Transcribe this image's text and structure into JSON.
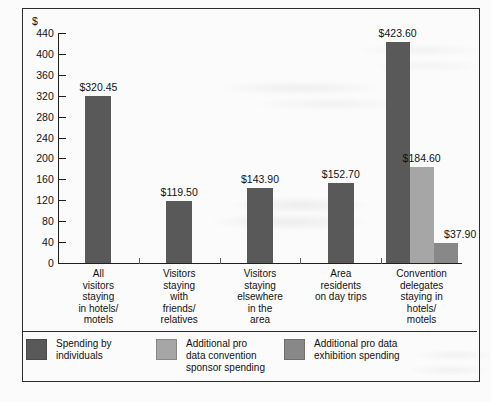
{
  "chart_data": {
    "type": "bar",
    "title": "",
    "xlabel": "",
    "ylabel": "$",
    "ylim": [
      0,
      440
    ],
    "yticks": [
      0,
      40,
      80,
      120,
      160,
      200,
      240,
      280,
      320,
      360,
      400,
      440
    ],
    "ytick_labels": [
      "0",
      "40",
      "80",
      "120",
      "160",
      "200",
      "240",
      "280",
      "320",
      "360",
      "400",
      "440"
    ],
    "grid": false,
    "legend_position": "bottom-left",
    "categories": [
      "All\nvisitors\nstaying\nin hotels/\nmotels",
      "Visitors\nstaying\nwith\nfriends/\nrelatives",
      "Visitors\nstaying\nelsewhere\nin the\narea",
      "Area\nresidents\non day trips",
      "Convention\ndelegates\nstaying in\nhotels/\nmotels"
    ],
    "series": [
      {
        "name": "Spending by\nindividuals",
        "color": "#595959",
        "values": [
          320.45,
          119.5,
          143.9,
          152.7,
          423.6
        ],
        "labels": [
          "$320.45",
          "$119.50",
          "$143.90",
          "$152.70",
          "$423.60"
        ]
      },
      {
        "name": "Additional pro\ndata convention\nsponsor spending",
        "color": "#a6a6a6",
        "values": [
          null,
          null,
          null,
          null,
          184.6
        ],
        "labels": [
          "",
          "",
          "",
          "",
          "$184.60"
        ]
      },
      {
        "name": "Additional pro data\nexhibition spending",
        "color": "#888888",
        "values": [
          null,
          null,
          null,
          null,
          37.9
        ],
        "labels": [
          "",
          "",
          "",
          "",
          "$37.90"
        ]
      }
    ]
  },
  "axis": {
    "currency_symbol": "$"
  },
  "legend": {
    "items": [
      {
        "label": "Spending by\nindividuals",
        "color": "#595959"
      },
      {
        "label": "Additional pro\ndata convention\nsponsor spending",
        "color": "#a6a6a6"
      },
      {
        "label": "Additional pro data\nexhibition spending",
        "color": "#888888"
      }
    ]
  }
}
